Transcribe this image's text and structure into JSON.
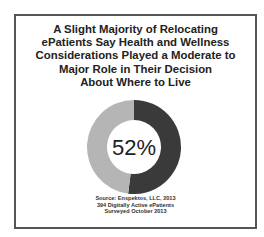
{
  "title_lines": [
    "A Slight Majority of Relocating",
    "ePatients Say Health and Wellness",
    "Considerations Played a Moderate to",
    "Major Role in Their Decision",
    "About Where to Live"
  ],
  "center_label": "52%",
  "source_lines": [
    "Source: Enspektos, LLC, 2013",
    "394 Digitally Active ePatients",
    "Surveyed October 2013"
  ],
  "colors": {
    "primary": "#3a3a3a",
    "secondary": "#b5b5b5",
    "border": "#555555"
  },
  "chart_data": {
    "type": "pie",
    "subtype": "donut",
    "title": "A Slight Majority of Relocating ePatients Say Health and Wellness Considerations Played a Moderate to Major Role in Their Decision About Where to Live",
    "categories": [
      "Moderate to Major Role",
      "Other"
    ],
    "values": [
      52,
      48
    ],
    "center_label": "52%",
    "source": "Source: Enspektos, LLC, 2013; 394 Digitally Active ePatients; Surveyed October 2013",
    "legend": "none"
  }
}
